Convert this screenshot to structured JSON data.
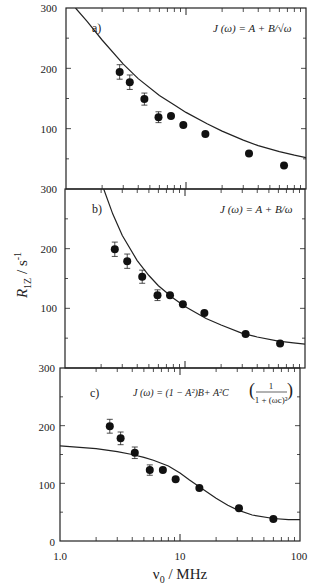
{
  "chart_data": [
    {
      "type": "scatter",
      "panel": "a)",
      "formula": "J (ω) = A + B/√ω",
      "x": [
        2.8,
        3.4,
        4.5,
        5.9,
        7.5,
        9.5,
        14.5,
        33.5,
        65.6
      ],
      "values": [
        194,
        177,
        149,
        119,
        121,
        106,
        91,
        59,
        39
      ],
      "error": [
        12,
        12,
        10,
        9,
        0,
        0,
        0,
        0,
        0
      ],
      "fit": {
        "x": [
          1.2,
          1.5,
          2,
          3,
          4,
          6,
          8,
          10,
          15,
          20,
          30,
          40,
          60,
          80,
          100
        ],
        "y": [
          300,
          278,
          247,
          207,
          183,
          155,
          139,
          127,
          108,
          96,
          81,
          72,
          62,
          56,
          52
        ]
      },
      "xlabel": "ν0 / MHz",
      "ylabel": "R1Z / s-1",
      "xscale": "log",
      "xlim": [
        1,
        100
      ],
      "ylim": [
        0,
        300
      ],
      "yticks": [
        100,
        200,
        300
      ]
    },
    {
      "type": "scatter",
      "panel": "b)",
      "formula": "J (ω) = A + B/ω",
      "x": [
        2.6,
        3.3,
        4.4,
        5.9,
        7.5,
        9.6,
        14.5,
        32,
        62
      ],
      "values": [
        199,
        179,
        153,
        122,
        122,
        107,
        92,
        57,
        41
      ],
      "error": [
        12,
        12,
        11,
        9,
        0,
        0,
        0,
        0,
        0
      ],
      "fit": {
        "x": [
          2.1,
          2.5,
          3,
          4,
          5,
          6,
          8,
          10,
          15,
          20,
          30,
          40,
          60,
          80,
          100
        ],
        "y": [
          300,
          258,
          222,
          180,
          155,
          138,
          117,
          103,
          83,
          72,
          58,
          52,
          45,
          42,
          40
        ]
      },
      "xlabel": "ν0 / MHz",
      "ylabel": "R1Z / s-1",
      "xscale": "log",
      "xlim": [
        1,
        100
      ],
      "ylim": [
        0,
        300
      ],
      "yticks": [
        100,
        200,
        300
      ]
    },
    {
      "type": "scatter",
      "panel": "c)",
      "formula": "J (ω) = (1 − A²)B + A²C (1 / (1 + (ωc)²))",
      "x": [
        2.6,
        3.2,
        4.2,
        5.6,
        7.2,
        9.2,
        14.5,
        31,
        60
      ],
      "values": [
        199,
        178,
        153,
        123,
        123,
        107,
        92,
        57,
        38
      ],
      "error": [
        12,
        11,
        10,
        9,
        0,
        0,
        0,
        0,
        0
      ],
      "fit": {
        "x": [
          1,
          2,
          3,
          4,
          5,
          6,
          8,
          10,
          12,
          15,
          20,
          25,
          30,
          40,
          60,
          80,
          100
        ],
        "y": [
          165,
          160,
          155,
          150,
          145,
          140,
          130,
          118,
          106,
          92,
          74,
          62,
          54,
          45,
          39,
          37,
          37
        ]
      },
      "xlabel": "ν0 / MHz",
      "ylabel": "R1Z / s-1",
      "xscale": "log",
      "xlim": [
        1,
        100
      ],
      "ylim": [
        0,
        300
      ],
      "yticks": [
        0,
        100,
        200,
        300
      ]
    }
  ],
  "axes": {
    "ylabel_main": "R",
    "ylabel_sub": "1Z",
    "ylabel_unit": " / s",
    "ylabel_exp": "-1",
    "xlabel_main": "ν",
    "xlabel_sub": "0",
    "xlabel_unit": " / MHz",
    "xtick_labels": [
      "1.0",
      "10",
      "100"
    ]
  },
  "panels": [
    {
      "label": "a)",
      "formula": "J (ω) = A + B/√ω",
      "ytick_labels": [
        "300",
        "200",
        "100"
      ]
    },
    {
      "label": "b)",
      "formula": "J (ω) = A + B/ω",
      "ytick_labels": [
        "300",
        "200",
        "100"
      ]
    },
    {
      "label": "c)",
      "formula_main": "J (ω) = (1 − A²)B+ A²C",
      "formula_num": "1",
      "formula_den": "1 + (ωc)²",
      "ytick_labels": [
        "300",
        "200",
        "100",
        "0"
      ]
    }
  ]
}
